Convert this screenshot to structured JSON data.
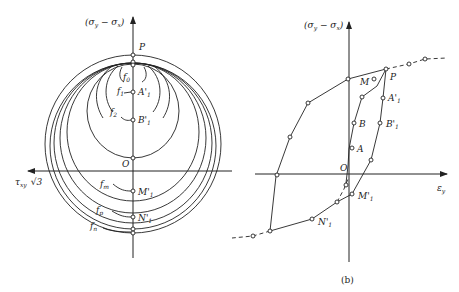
{
  "left_diagram": {
    "vertical_axis_label": "(σy − σx)",
    "horizontal_axis_label": "τxy √3",
    "axis_points": [
      {
        "label": "P",
        "y": 55
      },
      {
        "label": "",
        "y": 63
      },
      {
        "label": "A'1",
        "y": 92
      },
      {
        "label": "B'1",
        "y": 120
      },
      {
        "label": "O",
        "y": 158
      },
      {
        "label": "M'1",
        "y": 191
      },
      {
        "label": "N'1",
        "y": 217
      },
      {
        "label": "",
        "y": 229
      },
      {
        "label": "",
        "y": 233
      }
    ],
    "curve_labels": [
      "f0",
      "f1",
      "f2",
      "fm",
      "fp",
      "fn"
    ],
    "labels": {
      "P": "P",
      "f0": "f",
      "f0_sub": "0",
      "f1": "f",
      "f1_sub": "1",
      "f2": "f",
      "f2_sub": "2",
      "A1": "A'",
      "A1_sub": "1",
      "B1": "B'",
      "B1_sub": "1",
      "O": "O",
      "fm": "f",
      "fm_sub": "m",
      "M1": "M'",
      "M1_sub": "1",
      "fp": "f",
      "fp_sub": "p",
      "N1": "N'",
      "N1_sub": "1",
      "fn": "f",
      "fn_sub": "n",
      "tau": "τ",
      "tau_sub": "xy",
      "sqrt3": "√3",
      "v_axis": "(σ",
      "v_axis_sub1": "y",
      "v_axis_mid": " − σ",
      "v_axis_sub2": "x",
      "v_axis_end": ")"
    }
  },
  "right_diagram": {
    "vertical_axis_label": "(σy − σx)",
    "horizontal_axis_label": "εy",
    "caption": "(b)",
    "point_labels": [
      "M",
      "P",
      "A'1",
      "B'1",
      "B",
      "A",
      "O",
      "M'1",
      "N'1"
    ],
    "labels": {
      "M": "M",
      "P": "P",
      "A1": "A'",
      "A1_sub": "1",
      "B1": "B'",
      "B1_sub": "1",
      "B": "B",
      "A": "A",
      "O": "O",
      "M1": "M'",
      "M1_sub": "1",
      "N1": "N'",
      "N1_sub": "1",
      "eps": "ε",
      "eps_sub": "y",
      "v_axis": "(σ",
      "v_axis_sub1": "y",
      "v_axis_mid": " − σ",
      "v_axis_sub2": "x",
      "v_axis_end": ")",
      "caption": "(b)"
    }
  }
}
